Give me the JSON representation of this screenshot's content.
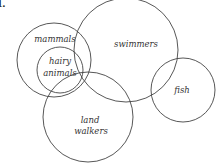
{
  "figure": {
    "number_label": "1.",
    "stroke_color": "#444444",
    "text_color": "#333333"
  },
  "sets": [
    {
      "id": "mammals",
      "label_lines": [
        "mammals"
      ],
      "cx": 54,
      "cy": 60,
      "r": 37,
      "label_x": 55,
      "label_y": 42
    },
    {
      "id": "hairy-animals",
      "label_lines": [
        "hairy",
        "animals"
      ],
      "cx": 60,
      "cy": 70,
      "r": 23,
      "label_x": 60,
      "label_y": 63
    },
    {
      "id": "swimmers",
      "label_lines": [
        "swimmers"
      ],
      "cx": 126,
      "cy": 50,
      "r": 52,
      "label_x": 136,
      "label_y": 46
    },
    {
      "id": "land-walkers",
      "label_lines": [
        "land",
        "walkers"
      ],
      "cx": 88,
      "cy": 117,
      "r": 45,
      "label_x": 91,
      "label_y": 123
    },
    {
      "id": "fish",
      "label_lines": [
        "fish"
      ],
      "cx": 183,
      "cy": 90,
      "r": 32,
      "label_x": 182,
      "label_y": 93
    }
  ]
}
